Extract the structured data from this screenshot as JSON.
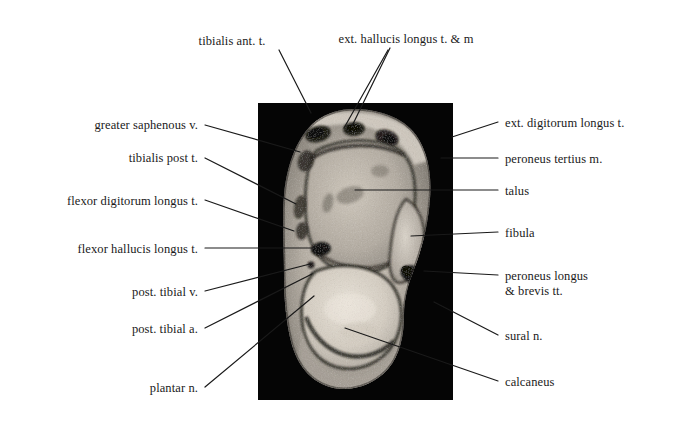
{
  "figure": {
    "type": "annotated-mri-cross-section",
    "modality": "MRI",
    "region": "ankle / hindfoot axial cross-section",
    "background_color": "#ffffff",
    "text_color": "#1a1a1a",
    "leader_line_color": "#1a1a1a",
    "image_panel": {
      "name": "mri-image",
      "background_color": "#050505",
      "left": 258,
      "top": 103,
      "width": 195,
      "height": 297
    }
  },
  "labels": {
    "top": [
      {
        "id": "tibialis-ant-t",
        "text": "tibialis ant. t.",
        "align": "center",
        "x": 232,
        "y": 34,
        "leaders": [
          [
            279,
            50
          ],
          [
            311,
            113
          ]
        ]
      },
      {
        "id": "ext-hallucis-longus-t-m",
        "text": "ext. hallucis longus t. & m",
        "align": "center",
        "x": 406,
        "y": 32,
        "leaders": [
          [
            390,
            48
          ],
          [
            352,
            126
          ]
        ]
      }
    ],
    "left": [
      {
        "id": "greater-saphenous-v",
        "text": "greater saphenous v.",
        "align": "right",
        "x": 198,
        "y": 118,
        "leaders": [
          [
            205,
            125
          ],
          [
            300,
            152
          ]
        ]
      },
      {
        "id": "tibialis-post-t",
        "text": "tibialis post t.",
        "align": "right",
        "x": 198,
        "y": 151,
        "leaders": [
          [
            205,
            158
          ],
          [
            296,
            204
          ]
        ]
      },
      {
        "id": "flexor-digitorum-longus-t",
        "text": "flexor digitorum longus t.",
        "align": "right",
        "x": 198,
        "y": 194,
        "leaders": [
          [
            205,
            200
          ],
          [
            294,
            231
          ]
        ]
      },
      {
        "id": "flexor-hallucis-longus-t",
        "text": "flexor hallucis longus t.",
        "align": "right",
        "x": 198,
        "y": 242,
        "leaders": [
          [
            205,
            248
          ],
          [
            316,
            248
          ]
        ]
      },
      {
        "id": "post-tibial-v",
        "text": "post. tibial v.",
        "align": "right",
        "x": 198,
        "y": 285,
        "leaders": [
          [
            205,
            291
          ],
          [
            310,
            264
          ]
        ]
      },
      {
        "id": "post-tibial-a",
        "text": "post. tibial a.",
        "align": "right",
        "x": 198,
        "y": 322,
        "leaders": [
          [
            205,
            328
          ],
          [
            312,
            274
          ]
        ]
      },
      {
        "id": "plantar-n",
        "text": "plantar n.",
        "align": "right",
        "x": 198,
        "y": 381,
        "leaders": [
          [
            205,
            387
          ],
          [
            314,
            296
          ]
        ]
      }
    ],
    "right": [
      {
        "id": "ext-digitorum-longus-t",
        "text": "ext. digitorum longus t.",
        "align": "left",
        "x": 505,
        "y": 116,
        "leaders": [
          [
            498,
            122
          ],
          [
            452,
            137
          ]
        ]
      },
      {
        "id": "peroneus-tertius-m",
        "text": "peroneus tertius m.",
        "align": "left",
        "x": 505,
        "y": 152,
        "leaders": [
          [
            498,
            158
          ],
          [
            441,
            158
          ]
        ]
      },
      {
        "id": "talus",
        "text": "talus",
        "align": "left",
        "x": 505,
        "y": 184,
        "leaders": [
          [
            498,
            190
          ],
          [
            355,
            190
          ]
        ]
      },
      {
        "id": "fibula",
        "text": "fibula",
        "align": "left",
        "x": 505,
        "y": 226,
        "leaders": [
          [
            498,
            232
          ],
          [
            411,
            236
          ]
        ]
      },
      {
        "id": "peroneus-longus-brevis-tt",
        "text": "peroneus longus",
        "text_line2": "& brevis tt.",
        "align": "left",
        "x": 505,
        "y": 269,
        "leaders": [
          [
            498,
            275
          ],
          [
            424,
            271
          ]
        ]
      },
      {
        "id": "sural-n",
        "text": "sural n.",
        "align": "left",
        "x": 505,
        "y": 329,
        "leaders": [
          [
            498,
            335
          ],
          [
            434,
            302
          ]
        ]
      },
      {
        "id": "calcaneus",
        "text": "calcaneus",
        "align": "left",
        "x": 505,
        "y": 375,
        "leaders": [
          [
            498,
            381
          ],
          [
            345,
            328
          ]
        ]
      }
    ]
  },
  "mri_render": {
    "panel_background": "#050505",
    "soft_tissue_color": "#b9b3aa",
    "bright_marrow_color": "#e2dcd2",
    "cortical_dark_color": "#2b2824",
    "skin_rim_color": "#8e8981"
  }
}
